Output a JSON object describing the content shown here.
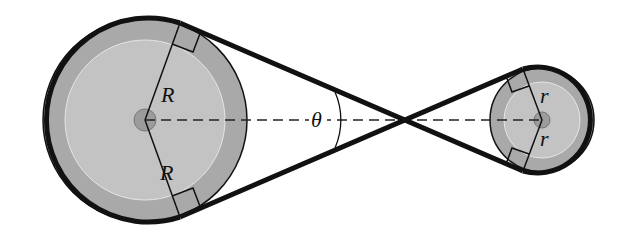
{
  "diagram": {
    "type": "belt-and-pulley",
    "labels": {
      "large_radius_top": "R",
      "large_radius_bottom": "R",
      "small_radius_top": "r",
      "small_radius_bottom": "r",
      "angle": "θ"
    },
    "colors": {
      "pulley_outer": "#a8a8a8",
      "pulley_inner": "#c4c4c4",
      "hub": "#9a9a9a",
      "belt": "#111111",
      "centerline": "#222222"
    },
    "large_pulley": {
      "cx": 145,
      "cy": 120,
      "r": 103
    },
    "small_pulley": {
      "cx": 542,
      "cy": 120,
      "r": 53
    },
    "crossing_point": {
      "x": 400,
      "y": 120
    }
  }
}
